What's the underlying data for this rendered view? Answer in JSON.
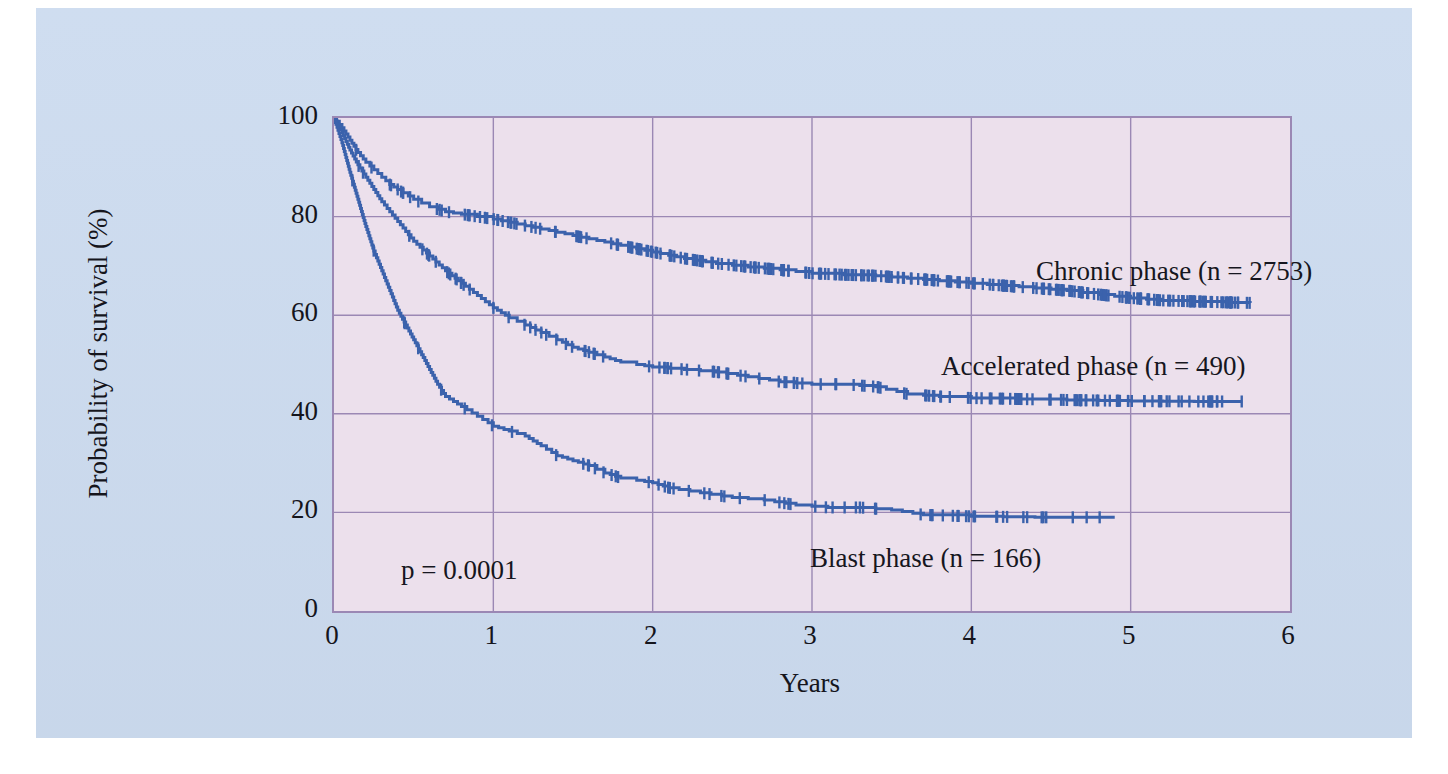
{
  "figure": {
    "background_color": "#ccdbef",
    "plot_background_color": "#ece0ec",
    "grid_color": "#9b88b4",
    "curve_color": "#3b62ac",
    "caption": ""
  },
  "axes": {
    "y_title": "Probability of survival (%)",
    "x_title": "Years",
    "y_ticks": [
      "0",
      "20",
      "40",
      "60",
      "80",
      "100"
    ],
    "x_ticks": [
      "0",
      "1",
      "2",
      "3",
      "4",
      "5",
      "6"
    ]
  },
  "annotations": {
    "p_value": "p = 0.0001",
    "chronic_label": "Chronic phase (n = 2753)",
    "accelerated_label": "Accelerated phase (n = 490)",
    "blast_label": "Blast phase (n = 166)"
  },
  "chart_data": {
    "type": "line",
    "xlabel": "Years",
    "ylabel": "Probability of survival (%)",
    "xlim": [
      0,
      6
    ],
    "ylim": [
      0,
      100
    ],
    "xticks": [
      0,
      1,
      2,
      3,
      4,
      5,
      6
    ],
    "yticks": [
      0,
      20,
      40,
      60,
      80,
      100
    ],
    "grid": true,
    "legend": "inline-annotations",
    "step_style": "kaplan-meier with censoring tick marks",
    "pvalue": 0.0001,
    "series": [
      {
        "name": "Chronic phase",
        "n": 2753,
        "color": "#3b62ac",
        "final_survival_pct": 62.5,
        "x": [
          0,
          0.05,
          0.1,
          0.15,
          0.2,
          0.25,
          0.3,
          0.35,
          0.4,
          0.5,
          0.6,
          0.7,
          0.8,
          0.9,
          1.0,
          1.15,
          1.3,
          1.45,
          1.6,
          1.75,
          1.9,
          2.05,
          2.2,
          2.4,
          2.6,
          2.8,
          3.0,
          3.2,
          3.4,
          3.6,
          3.8,
          4.0,
          4.2,
          4.4,
          4.6,
          4.8,
          5.0,
          5.2,
          5.4,
          5.6,
          5.75
        ],
        "y": [
          100,
          98,
          95.5,
          93,
          91,
          89.5,
          88,
          86.5,
          85.5,
          83.5,
          82,
          81,
          80.5,
          80,
          79.5,
          78.5,
          77.5,
          76.5,
          75.5,
          74.5,
          73.5,
          72.5,
          71.5,
          70.5,
          69.8,
          69.2,
          68.5,
          68.2,
          68.0,
          67.5,
          67.0,
          66.5,
          66.0,
          65.5,
          65.0,
          64.2,
          63.5,
          63.0,
          62.8,
          62.6,
          62.5
        ]
      },
      {
        "name": "Accelerated phase",
        "n": 490,
        "color": "#3b62ac",
        "final_survival_pct": 42.5,
        "x": [
          0,
          0.05,
          0.1,
          0.15,
          0.2,
          0.25,
          0.3,
          0.35,
          0.4,
          0.45,
          0.5,
          0.6,
          0.7,
          0.8,
          0.9,
          1.0,
          1.1,
          1.2,
          1.3,
          1.4,
          1.5,
          1.6,
          1.7,
          1.8,
          1.9,
          2.0,
          2.2,
          2.4,
          2.6,
          2.8,
          3.0,
          3.2,
          3.4,
          3.6,
          3.8,
          4.0,
          4.3,
          4.6,
          5.0,
          5.4,
          5.7
        ],
        "y": [
          100,
          97,
          93.5,
          90.5,
          88,
          85.5,
          83,
          81,
          79,
          77,
          75,
          72,
          69,
          66.5,
          64,
          61.5,
          59.5,
          58,
          56.5,
          55,
          53.5,
          52.5,
          51.5,
          50.5,
          50,
          49.5,
          49,
          48.5,
          47.5,
          46.5,
          46.0,
          46.0,
          45.5,
          44.0,
          43.5,
          43.2,
          43.0,
          42.8,
          42.6,
          42.5,
          42.5
        ]
      },
      {
        "name": "Blast phase",
        "n": 166,
        "color": "#3b62ac",
        "final_survival_pct": 19.0,
        "x": [
          0,
          0.05,
          0.1,
          0.15,
          0.2,
          0.25,
          0.3,
          0.35,
          0.4,
          0.45,
          0.5,
          0.55,
          0.6,
          0.65,
          0.7,
          0.8,
          0.9,
          1.0,
          1.1,
          1.2,
          1.3,
          1.4,
          1.5,
          1.6,
          1.7,
          1.8,
          1.9,
          2.0,
          2.1,
          2.3,
          2.5,
          2.7,
          2.9,
          3.1,
          3.3,
          3.5,
          3.7,
          4.0,
          4.4,
          4.9
        ],
        "y": [
          100,
          95,
          89,
          83.5,
          78,
          73,
          69,
          65,
          61,
          58,
          55,
          52,
          49,
          46,
          43.5,
          41.5,
          39.5,
          37.5,
          36.5,
          35.5,
          33.5,
          31.5,
          30.5,
          29.5,
          28.0,
          27.0,
          26.5,
          26.0,
          25.0,
          24.0,
          23.0,
          22.5,
          21.5,
          21.0,
          21.0,
          20.5,
          19.5,
          19.2,
          19.0,
          19.0
        ]
      }
    ]
  }
}
